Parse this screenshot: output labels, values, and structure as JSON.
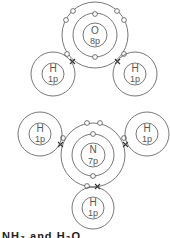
{
  "diagram": {
    "type": "electron-shell-diagram",
    "colors": {
      "line": "#555555",
      "cross": "#333333",
      "background": "#ffffff"
    },
    "molecules": [
      {
        "name": "water",
        "central_atom": {
          "symbol": "O",
          "protons": "8p"
        },
        "hydrogens": [
          {
            "symbol": "H",
            "protons": "1p",
            "position": "left"
          },
          {
            "symbol": "H",
            "protons": "1p",
            "position": "right"
          }
        ]
      },
      {
        "name": "ammonia",
        "central_atom": {
          "symbol": "N",
          "protons": "7p"
        },
        "hydrogens": [
          {
            "symbol": "H",
            "protons": "1p",
            "position": "left"
          },
          {
            "symbol": "H",
            "protons": "1p",
            "position": "right"
          },
          {
            "symbol": "H",
            "protons": "1p",
            "position": "bottom"
          }
        ]
      }
    ],
    "caption": "NH₃ and H₂O"
  }
}
